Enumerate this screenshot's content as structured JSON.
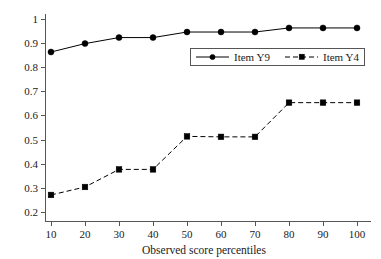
{
  "chart_data": {
    "type": "line",
    "title": "",
    "subtitle": "",
    "xlabel": "Observed score percentiles",
    "ylabel": "",
    "x": [
      10,
      20,
      30,
      40,
      50,
      60,
      70,
      80,
      90,
      100
    ],
    "xtick_labels": [
      "10",
      "20",
      "30",
      "40",
      "50",
      "60",
      "70",
      "80",
      "90",
      "100"
    ],
    "ytick_labels": [
      "0.2",
      "0.3",
      "0.4",
      "0.5",
      "0.6",
      "0.7",
      "0.8",
      "0.9",
      "1"
    ],
    "ytick_values": [
      0.2,
      0.3,
      0.4,
      0.5,
      0.6,
      0.7,
      0.8,
      0.9,
      1.0
    ],
    "xlim": [
      5,
      105
    ],
    "ylim": [
      0.17,
      1.03
    ],
    "grid": false,
    "legend_position": "upper-right-inside",
    "series": [
      {
        "name": "Item Y9",
        "marker": "circle",
        "linestyle": "solid",
        "color": "#000000",
        "values": [
          0.865,
          0.9,
          0.925,
          0.925,
          0.948,
          0.948,
          0.948,
          0.965,
          0.965,
          0.965
        ]
      },
      {
        "name": "Item Y4",
        "marker": "square",
        "linestyle": "dashed",
        "color": "#000000",
        "values": [
          0.272,
          0.305,
          0.378,
          0.378,
          0.515,
          0.513,
          0.513,
          0.655,
          0.655,
          0.655
        ]
      }
    ]
  },
  "legend": {
    "entries": [
      {
        "label": "Item Y9"
      },
      {
        "label": "Item Y4"
      }
    ]
  },
  "colors": {
    "axis": "#555555",
    "series": "#000000",
    "background": "#ffffff",
    "text": "#1a1a1a"
  }
}
